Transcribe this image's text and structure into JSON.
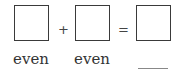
{
  "equation": {
    "operator_plus": "+",
    "operator_equals": "=",
    "labels": [
      "even",
      "even",
      ""
    ],
    "answer_blank": true
  }
}
